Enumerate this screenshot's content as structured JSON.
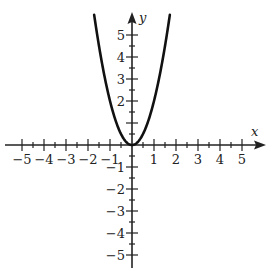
{
  "chart_data": {
    "type": "line",
    "title": "",
    "function": "y = 2x^2",
    "xlabel": "x",
    "ylabel": "y",
    "xlim": [
      -5.5,
      5.8
    ],
    "ylim": [
      -5.4,
      5.8
    ],
    "grid": false,
    "x_tick_labels": [
      "-5",
      "-4",
      "-3",
      "-2",
      "-1",
      "1",
      "2",
      "3",
      "4",
      "5"
    ],
    "y_tick_labels": [
      "5",
      "4",
      "3",
      "2",
      "-1",
      "-2",
      "-3",
      "-4",
      "-5"
    ],
    "minor_ticks": 0.5,
    "series": [
      {
        "name": "parabola",
        "x": [
          -1.7,
          -1.5,
          -1.25,
          -1,
          -0.75,
          -0.5,
          -0.25,
          0,
          0.25,
          0.5,
          0.75,
          1,
          1.25,
          1.5,
          1.7
        ],
        "values": [
          5.78,
          4.5,
          3.125,
          2,
          1.125,
          0.5,
          0.125,
          0,
          0.125,
          0.5,
          1.125,
          2,
          3.125,
          4.5,
          5.78
        ]
      }
    ],
    "colors": {
      "curve": "#111111",
      "axes": "#222222"
    }
  },
  "labels": {
    "x_axis": "x",
    "y_axis": "y",
    "x_ticks": [
      "−5",
      "−4",
      "−3",
      "−2",
      "−1",
      "1",
      "2",
      "3",
      "4",
      "5"
    ],
    "y_ticks_pos": [
      "5",
      "4",
      "3",
      "2"
    ],
    "y_ticks_neg": [
      "−1",
      "−2",
      "−3",
      "−4",
      "−5"
    ]
  }
}
